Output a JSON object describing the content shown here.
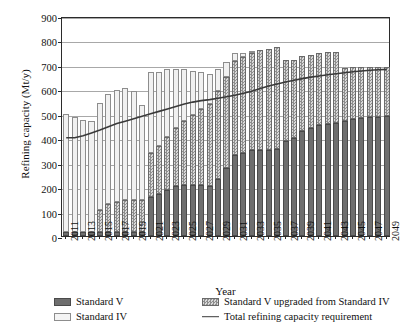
{
  "chart_data": {
    "type": "bar",
    "title": "",
    "xlabel": "Year",
    "ylabel": "Refining capacity (Mt/y)",
    "ylim": [
      0,
      900
    ],
    "ytick_step": 100,
    "yticks": [
      0,
      100,
      200,
      300,
      400,
      500,
      600,
      700,
      800,
      900
    ],
    "grid": true,
    "stacked": true,
    "legend_position": "bottom",
    "categories": [
      "2011",
      "2012",
      "2013",
      "2014",
      "2015",
      "2016",
      "2017",
      "2018",
      "2019",
      "2020",
      "2021",
      "2022",
      "2023",
      "2024",
      "2025",
      "2026",
      "2027",
      "2028",
      "2029",
      "2030",
      "2031",
      "2032",
      "2033",
      "2034",
      "2035",
      "2036",
      "2037",
      "2038",
      "2039",
      "2040",
      "2041",
      "2042",
      "2043",
      "2044",
      "2045",
      "2046",
      "2047",
      "2048",
      "2049"
    ],
    "xtick_labels": [
      "2011",
      "2013",
      "2015",
      "2017",
      "2019",
      "2021",
      "2023",
      "2025",
      "2027",
      "2029",
      "2031",
      "2033",
      "2035",
      "2037",
      "2039",
      "2041",
      "2043",
      "2045",
      "2047",
      "2049"
    ],
    "series": [
      {
        "name": "Standard V",
        "key": "sv",
        "color": "#6e6e6e",
        "values": [
          18,
          18,
          18,
          18,
          18,
          18,
          18,
          18,
          18,
          18,
          160,
          172,
          190,
          205,
          208,
          208,
          207,
          205,
          233,
          280,
          333,
          340,
          350,
          352,
          353,
          355,
          390,
          400,
          430,
          440,
          455,
          460,
          462,
          470,
          478,
          482,
          486,
          488,
          490
        ]
      },
      {
        "name": "Standard V upgraded from Standard IV",
        "key": "sup",
        "color": "#a6a6a6",
        "values": [
          0,
          0,
          0,
          0,
          90,
          112,
          120,
          128,
          128,
          128,
          180,
          196,
          214,
          238,
          262,
          288,
          312,
          336,
          360,
          372,
          383,
          392,
          400,
          408,
          412,
          418,
          330,
          318,
          305,
          300,
          295,
          292,
          290,
          218,
          212,
          209,
          206,
          203,
          200
        ]
      },
      {
        "name": "Standard IV",
        "key": "siv",
        "color": "#f1f1f1",
        "values": [
          482,
          468,
          458,
          452,
          438,
          450,
          458,
          460,
          448,
          390,
          332,
          302,
          280,
          240,
          212,
          180,
          152,
          120,
          92,
          60,
          34,
          18,
          8,
          0,
          0,
          0,
          0,
          0,
          0,
          0,
          0,
          0,
          0,
          0,
          0,
          0,
          0,
          0,
          0
        ]
      }
    ],
    "line_series": {
      "name": "Total refining capacity requirement",
      "color": "#3a3a3a",
      "values": [
        410,
        410,
        418,
        430,
        442,
        455,
        468,
        478,
        488,
        498,
        508,
        518,
        528,
        538,
        548,
        556,
        562,
        566,
        572,
        578,
        584,
        592,
        600,
        612,
        622,
        630,
        638,
        645,
        652,
        658,
        663,
        668,
        672,
        676,
        680,
        683,
        686,
        688,
        690
      ]
    }
  },
  "legend": {
    "items": [
      {
        "label": "Standard V",
        "swatch": "sv"
      },
      {
        "label": "Standard IV",
        "swatch": "siv"
      },
      {
        "label": "Standard V upgraded from Standard IV",
        "swatch": "sup"
      },
      {
        "label": "Total refining capacity requirement",
        "swatch": "line"
      }
    ]
  }
}
